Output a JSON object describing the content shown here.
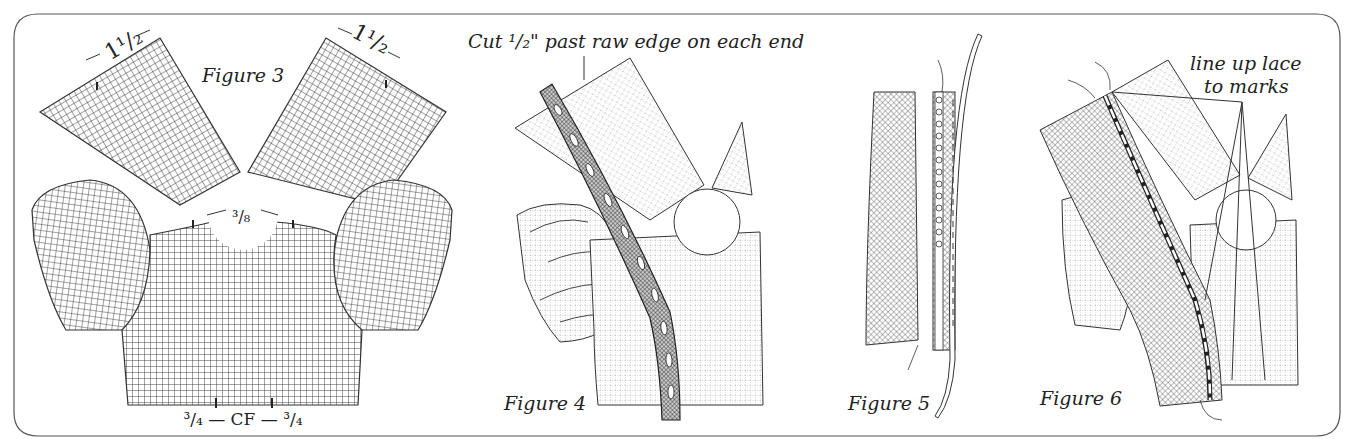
{
  "figure": {
    "panels": [
      {
        "id": "figure-3",
        "label": "Figure 3",
        "annotations": {
          "left_shoulder": "1¹/₂",
          "right_shoulder": "1¹/₂",
          "neckline": "³/₈",
          "center_front": "³/₄ — CF — ³/₄"
        }
      },
      {
        "id": "figure-4",
        "label": "Figure 4",
        "annotations": {
          "instruction": "Cut ¹/₂\" past raw edge on each end"
        }
      },
      {
        "id": "figure-5",
        "label": "Figure 5"
      },
      {
        "id": "figure-6",
        "label": "Figure 6",
        "annotations": {
          "instruction_line1": "line up lace",
          "instruction_line2": "to marks"
        }
      }
    ],
    "colors": {
      "ink": "#222222",
      "paper": "#ffffff",
      "frame": "#555555"
    }
  }
}
